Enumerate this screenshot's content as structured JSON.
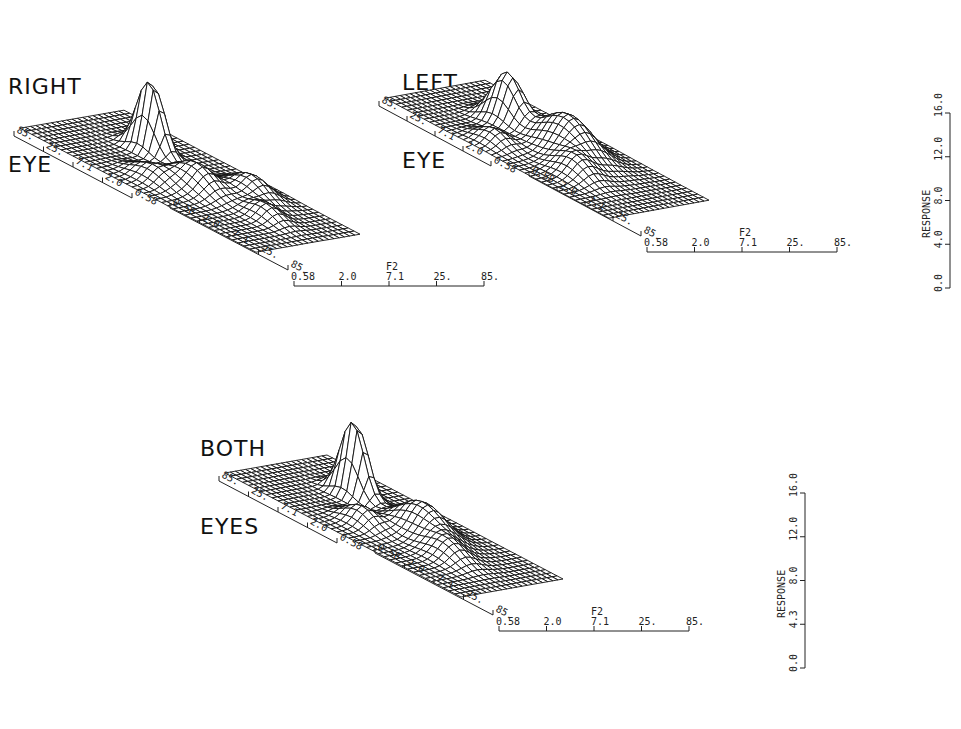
{
  "panels": [
    {
      "id": "right",
      "title_line1": "RIGHT",
      "title_line2": "EYE"
    },
    {
      "id": "left",
      "title_line1": "LEFT",
      "title_line2": "EYE"
    },
    {
      "id": "both",
      "title_line1": "BOTH",
      "title_line2": "EYES"
    }
  ],
  "chart_data": [
    {
      "type": "surface",
      "title": "RIGHT EYE",
      "axes": {
        "f1": {
          "label": "F1",
          "ticks": [
            "85.",
            "25.",
            "7.1",
            "2.0",
            "0.58"
          ]
        },
        "neg_f1": {
          "label": "-F1",
          "ticks": [
            "0.58",
            "2.0",
            "7.1",
            "25.",
            "85."
          ]
        },
        "f2": {
          "label": "F2",
          "ticks": [
            "0.58",
            "2.0",
            "7.1",
            "25.",
            "85."
          ]
        },
        "response": {
          "label": "RESPONSE",
          "ticks": [
            "0.0",
            "4.0",
            "8.0",
            "12.0",
            "16.0"
          ],
          "range": [
            0,
            16
          ]
        }
      },
      "peaks": [
        {
          "f1": "7.1",
          "f2": "0.58",
          "response": 16.0,
          "note": "tall narrow peak at back near F1 axis"
        },
        {
          "f1": "-7.1",
          "f2": "7.1",
          "response": 6.0,
          "note": "broad hump"
        },
        {
          "f1": "-2.0",
          "f2": "25.",
          "response": 5.0
        }
      ]
    },
    {
      "type": "surface",
      "title": "LEFT EYE",
      "axes": {
        "f1": {
          "label": "F1",
          "ticks": [
            "85.",
            "25.",
            "7.1",
            "2.0",
            "0.58"
          ]
        },
        "neg_f1": {
          "label": "-F1",
          "ticks": [
            "0.58",
            "2.0",
            "7.1",
            "25.",
            "85."
          ]
        },
        "f2": {
          "label": "F2",
          "ticks": [
            "0.58",
            "2.0",
            "7.1",
            "25.",
            "85."
          ]
        },
        "response": {
          "label": "RESPONSE",
          "ticks": [
            "0.0",
            "4.0",
            "8.0",
            "12.0",
            "16.0"
          ],
          "range": [
            0,
            16
          ]
        }
      },
      "peaks": [
        {
          "f1": "7.1",
          "f2": "2.0",
          "response": 11.0
        },
        {
          "f1": "-2.0",
          "f2": "7.1",
          "response": 9.0,
          "note": "broad central hump"
        }
      ]
    },
    {
      "type": "surface",
      "title": "BOTH EYES",
      "axes": {
        "f1": {
          "label": "F1",
          "ticks": [
            "85.",
            "25.",
            "7.1",
            "2.0",
            "0.58"
          ]
        },
        "neg_f1": {
          "label": "-F1",
          "ticks": [
            "0.58",
            "2.0",
            "7.1",
            "25.",
            "85."
          ]
        },
        "f2": {
          "label": "F2",
          "ticks": [
            "0.58",
            "2.0",
            "7.1",
            "25.",
            "85."
          ]
        },
        "response": {
          "label": "RESPONSE",
          "ticks": [
            "0.0",
            "4.3",
            "8.0",
            "12.0",
            "16.0"
          ],
          "range": [
            0,
            16
          ]
        }
      },
      "peaks": [
        {
          "f1": "7.1",
          "f2": "0.58",
          "response": 16.0,
          "note": "tall narrow peak"
        },
        {
          "f1": "-2.0",
          "f2": "7.1",
          "response": 6.5
        }
      ]
    }
  ],
  "render": {
    "surfaces": [
      {
        "panel": "right",
        "ox": 20,
        "oy": 130,
        "ux": 5.9,
        "uy": 3.1,
        "vx": 5.2,
        "vy": -0.9,
        "zs": 4.6,
        "bumps": [
          [
            0.28,
            0.62,
            16,
            0.05,
            0.06
          ],
          [
            0.55,
            0.45,
            5.5,
            0.08,
            0.1
          ],
          [
            0.65,
            0.75,
            4.5,
            0.07,
            0.1
          ],
          [
            0.45,
            0.25,
            3,
            0.07,
            0.08
          ],
          [
            0.8,
            0.55,
            3,
            0.06,
            0.08
          ]
        ]
      },
      {
        "panel": "left",
        "ox": 385,
        "oy": 100,
        "ux": 5.6,
        "uy": 3.0,
        "vx": 5.0,
        "vy": -0.9,
        "zs": 4.6,
        "bumps": [
          [
            0.3,
            0.55,
            11,
            0.06,
            0.09
          ],
          [
            0.55,
            0.6,
            8.5,
            0.1,
            0.14
          ],
          [
            0.7,
            0.35,
            4,
            0.07,
            0.1
          ],
          [
            0.4,
            0.2,
            3,
            0.06,
            0.08
          ]
        ]
      },
      {
        "panel": "both",
        "ox": 225,
        "oy": 475,
        "ux": 5.9,
        "uy": 3.1,
        "vx": 5.1,
        "vy": -0.9,
        "zs": 4.9,
        "bumps": [
          [
            0.28,
            0.62,
            16,
            0.05,
            0.06
          ],
          [
            0.58,
            0.6,
            6.5,
            0.09,
            0.12
          ],
          [
            0.45,
            0.3,
            3.5,
            0.06,
            0.08
          ],
          [
            0.75,
            0.45,
            3.5,
            0.07,
            0.1
          ]
        ]
      }
    ]
  }
}
